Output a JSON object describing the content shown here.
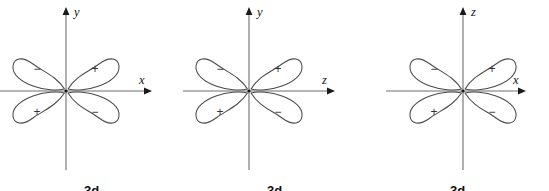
{
  "figure": {
    "background_color": "#ffffff",
    "line_color": "#4a4a4a",
    "axis_color": "#6e6e6e",
    "text_color": "#111111"
  },
  "panels": [
    {
      "id": "panel-1",
      "caption": "3d",
      "vertical_axis_label": "y",
      "horizontal_axis_label": "x",
      "lobes": [
        {
          "quadrant": "upper-left",
          "sign": "−"
        },
        {
          "quadrant": "upper-right",
          "sign": "+"
        },
        {
          "quadrant": "lower-left",
          "sign": "+"
        },
        {
          "quadrant": "lower-right",
          "sign": "−"
        }
      ]
    },
    {
      "id": "panel-2",
      "caption": "3d",
      "vertical_axis_label": "y",
      "horizontal_axis_label": "z",
      "lobes": [
        {
          "quadrant": "upper-left",
          "sign": "−"
        },
        {
          "quadrant": "upper-right",
          "sign": "+"
        },
        {
          "quadrant": "lower-left",
          "sign": "+"
        },
        {
          "quadrant": "lower-right",
          "sign": "−"
        }
      ]
    },
    {
      "id": "panel-3",
      "caption": "3d",
      "vertical_axis_label": "z",
      "horizontal_axis_label": "x",
      "lobes": [
        {
          "quadrant": "upper-left",
          "sign": "−"
        },
        {
          "quadrant": "upper-right",
          "sign": "+"
        },
        {
          "quadrant": "lower-left",
          "sign": "+"
        },
        {
          "quadrant": "lower-right",
          "sign": "−"
        }
      ]
    }
  ]
}
